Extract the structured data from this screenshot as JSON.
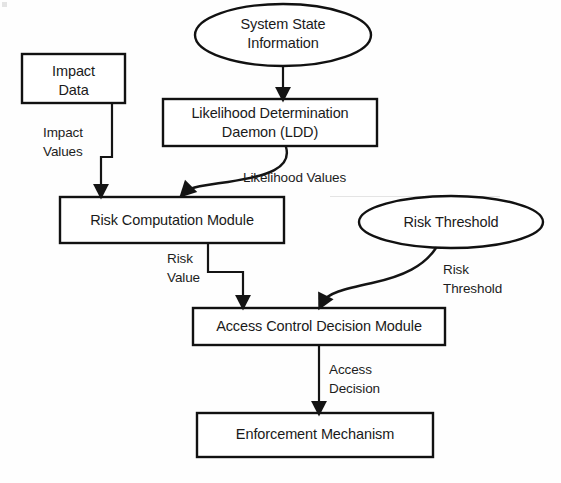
{
  "diagram": {
    "type": "flowchart",
    "colors": {
      "background": "#fefefe",
      "stroke": "#111111",
      "text": "#1a1a1a"
    },
    "nodes": [
      {
        "id": "impact-data",
        "label": "Impact\nData",
        "shape": "rectangle"
      },
      {
        "id": "system-state-information",
        "label": "System State\nInformation",
        "shape": "ellipse"
      },
      {
        "id": "likelihood-determination-daemon",
        "label": "Likelihood Determination\nDaemon (LDD)",
        "shape": "rectangle"
      },
      {
        "id": "risk-computation-module",
        "label": "Risk Computation Module",
        "shape": "rectangle"
      },
      {
        "id": "risk-threshold",
        "label": "Risk Threshold",
        "shape": "ellipse"
      },
      {
        "id": "access-control-decision-module",
        "label": "Access Control Decision Module",
        "shape": "rectangle"
      },
      {
        "id": "enforcement-mechanism",
        "label": "Enforcement Mechanism",
        "shape": "rectangle"
      }
    ],
    "edges": [
      {
        "id": "system-state-to-ldd",
        "from": "system-state-information",
        "to": "likelihood-determination-daemon",
        "label": ""
      },
      {
        "id": "impact-data-to-risk-computation",
        "from": "impact-data",
        "to": "risk-computation-module",
        "label": "Impact\nValues"
      },
      {
        "id": "ldd-to-risk-computation",
        "from": "likelihood-determination-daemon",
        "to": "risk-computation-module",
        "label": "Likelihood Values"
      },
      {
        "id": "risk-computation-to-access-control",
        "from": "risk-computation-module",
        "to": "access-control-decision-module",
        "label": "Risk\nValue"
      },
      {
        "id": "risk-threshold-to-access-control",
        "from": "risk-threshold",
        "to": "access-control-decision-module",
        "label": "Risk\nThreshold"
      },
      {
        "id": "access-control-to-enforcement",
        "from": "access-control-decision-module",
        "to": "enforcement-mechanism",
        "label": "Access\nDecision"
      }
    ]
  }
}
